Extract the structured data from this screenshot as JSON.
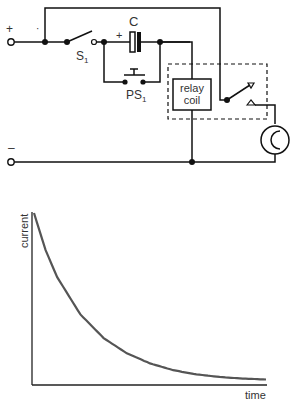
{
  "circuit": {
    "positive_terminal": "+",
    "negative_terminal": "–",
    "switch_label": "S",
    "switch_sub": "1",
    "capacitor_label": "C",
    "capacitor_polarity": "+",
    "pushbutton_label": "PS",
    "pushbutton_sub": "1",
    "relay_line1": "relay",
    "relay_line2": "coil",
    "stray_mark": "·"
  },
  "chart_data": {
    "type": "line",
    "title": "",
    "xlabel": "time",
    "ylabel": "current",
    "series": [
      {
        "name": "current decay",
        "x": [
          0,
          0.05,
          0.1,
          0.2,
          0.3,
          0.4,
          0.5,
          0.6,
          0.7,
          0.8,
          0.9,
          1.0
        ],
        "values": [
          1.0,
          0.78,
          0.62,
          0.4,
          0.26,
          0.17,
          0.11,
          0.07,
          0.045,
          0.03,
          0.02,
          0.015
        ]
      }
    ],
    "grid": false,
    "legend": "none",
    "xlim": [
      0,
      1
    ],
    "ylim": [
      0,
      1
    ]
  },
  "colors": {
    "line": "#111111",
    "curve": "#555555",
    "axis": "#222222"
  }
}
